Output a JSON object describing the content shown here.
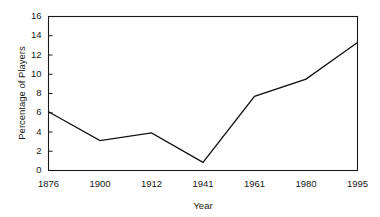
{
  "chart_data": {
    "type": "line",
    "title": "",
    "xlabel": "Year",
    "ylabel": "Percentage of Players",
    "categories": [
      "1876",
      "1900",
      "1912",
      "1941",
      "1961",
      "1980",
      "1995"
    ],
    "values": [
      6.1,
      3.1,
      3.9,
      0.85,
      7.7,
      9.5,
      13.3
    ],
    "series": [
      {
        "name": "Percentage of Players",
        "values": [
          6.1,
          3.1,
          3.9,
          0.85,
          7.7,
          9.5,
          13.3
        ]
      }
    ],
    "ylim": [
      0,
      16
    ],
    "yticks": [
      0,
      2,
      4,
      6,
      8,
      10,
      12,
      14,
      16
    ],
    "ytick_labels": [
      "0",
      "2",
      "4",
      "6",
      "8",
      "10",
      "12",
      "14",
      "16"
    ],
    "xtick_labels": [
      "1876",
      "1900",
      "1912",
      "1941",
      "1961",
      "1980",
      "1995"
    ],
    "grid": false,
    "legend": false,
    "legend_position": "none",
    "line_color": "#111111",
    "frame_color": "#1a1a1a",
    "background_color": "#ffffff"
  },
  "axes": {
    "y_title": "Percentage of Players",
    "x_title": "Year"
  }
}
